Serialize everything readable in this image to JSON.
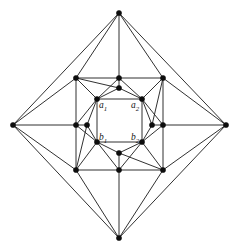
{
  "figure": {
    "name": "nested-diamond-planar-graph",
    "type": "graph-diagram",
    "background_color": "#ffffff",
    "edge_color": "#1a1a1a",
    "vertex_color": "#0d0d0d",
    "width": 239,
    "height": 251
  },
  "labels": [
    {
      "id": "a1",
      "text": "a",
      "subscript": "1",
      "x": 99,
      "y": 101
    },
    {
      "id": "a2",
      "text": "a",
      "subscript": "2",
      "x": 131,
      "y": 101
    },
    {
      "id": "b1",
      "text": "b",
      "subscript": "1",
      "x": 99,
      "y": 133
    },
    {
      "id": "b2",
      "text": "b",
      "subscript": "2",
      "x": 131,
      "y": 133
    }
  ],
  "graph_data": {
    "type": "graph",
    "vertex_radius": 2.6,
    "vertices": [
      {
        "id": "T",
        "x": 119,
        "y": 13,
        "ring": "apex"
      },
      {
        "id": "L",
        "x": 13,
        "y": 125,
        "ring": "apex"
      },
      {
        "id": "R",
        "x": 226,
        "y": 125,
        "ring": "apex"
      },
      {
        "id": "B",
        "x": 119,
        "y": 238,
        "ring": "apex"
      },
      {
        "id": "MTL",
        "x": 76,
        "y": 78,
        "ring": "middle"
      },
      {
        "id": "MT",
        "x": 119,
        "y": 78,
        "ring": "middle"
      },
      {
        "id": "MTR",
        "x": 163,
        "y": 78,
        "ring": "middle"
      },
      {
        "id": "MR",
        "x": 163,
        "y": 125,
        "ring": "middle"
      },
      {
        "id": "MBR",
        "x": 163,
        "y": 170,
        "ring": "middle"
      },
      {
        "id": "MB",
        "x": 119,
        "y": 170,
        "ring": "middle"
      },
      {
        "id": "MBL",
        "x": 76,
        "y": 170,
        "ring": "middle"
      },
      {
        "id": "ML",
        "x": 76,
        "y": 125,
        "ring": "middle"
      },
      {
        "id": "IT",
        "x": 119,
        "y": 88,
        "ring": "inner-mid"
      },
      {
        "id": "IR",
        "x": 152,
        "y": 125,
        "ring": "inner-mid"
      },
      {
        "id": "IB",
        "x": 119,
        "y": 153,
        "ring": "inner-mid"
      },
      {
        "id": "IL",
        "x": 87,
        "y": 125,
        "ring": "inner-mid"
      },
      {
        "id": "a1",
        "x": 97,
        "y": 99,
        "ring": "core"
      },
      {
        "id": "a2",
        "x": 142,
        "y": 99,
        "ring": "core"
      },
      {
        "id": "b2",
        "x": 142,
        "y": 142,
        "ring": "core"
      },
      {
        "id": "b1",
        "x": 97,
        "y": 142,
        "ring": "core"
      }
    ],
    "edges": [
      [
        "T",
        "L"
      ],
      [
        "T",
        "R"
      ],
      [
        "B",
        "L"
      ],
      [
        "B",
        "R"
      ],
      [
        "T",
        "MTL"
      ],
      [
        "T",
        "MT"
      ],
      [
        "T",
        "MTR"
      ],
      [
        "R",
        "MTR"
      ],
      [
        "R",
        "MR"
      ],
      [
        "R",
        "MBR"
      ],
      [
        "B",
        "MBR"
      ],
      [
        "B",
        "MB"
      ],
      [
        "B",
        "MBL"
      ],
      [
        "L",
        "MBL"
      ],
      [
        "L",
        "ML"
      ],
      [
        "L",
        "MTL"
      ],
      [
        "MTL",
        "MT"
      ],
      [
        "MT",
        "MTR"
      ],
      [
        "MTR",
        "MR"
      ],
      [
        "MR",
        "MBR"
      ],
      [
        "MBR",
        "MB"
      ],
      [
        "MB",
        "MBL"
      ],
      [
        "MBL",
        "ML"
      ],
      [
        "ML",
        "MTL"
      ],
      [
        "MTL",
        "a1"
      ],
      [
        "MT",
        "a1"
      ],
      [
        "MT",
        "a2"
      ],
      [
        "MTR",
        "a2"
      ],
      [
        "MTR",
        "IR"
      ],
      [
        "MR",
        "a2"
      ],
      [
        "MR",
        "b2"
      ],
      [
        "MBR",
        "b2"
      ],
      [
        "MBR",
        "IB"
      ],
      [
        "MB",
        "b2"
      ],
      [
        "MB",
        "b1"
      ],
      [
        "MBL",
        "b1"
      ],
      [
        "MBL",
        "IL"
      ],
      [
        "ML",
        "b1"
      ],
      [
        "ML",
        "a1"
      ],
      [
        "MTL",
        "IT"
      ],
      [
        "MT",
        "IT"
      ],
      [
        "MR",
        "IR"
      ],
      [
        "MB",
        "IB"
      ],
      [
        "ML",
        "IL"
      ],
      [
        "a1",
        "IT"
      ],
      [
        "IT",
        "a2"
      ],
      [
        "a2",
        "IR"
      ],
      [
        "IR",
        "b2"
      ],
      [
        "b2",
        "IB"
      ],
      [
        "IB",
        "b1"
      ],
      [
        "b1",
        "IL"
      ],
      [
        "IL",
        "a1"
      ],
      [
        "a1",
        "a2"
      ],
      [
        "a2",
        "b2"
      ],
      [
        "b2",
        "b1"
      ],
      [
        "b1",
        "a1"
      ]
    ]
  }
}
